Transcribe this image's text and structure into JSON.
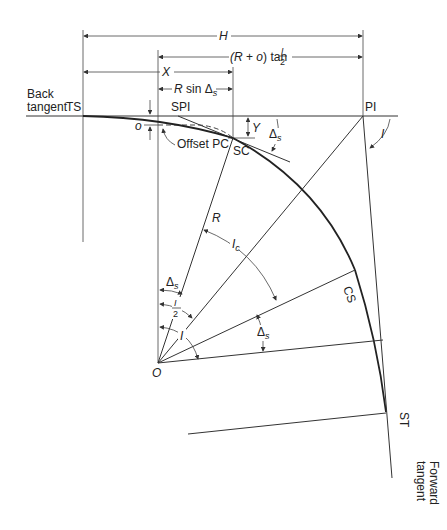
{
  "labels": {
    "back_tangent_line1": "Back",
    "back_tangent_line2": "tangent",
    "ts": "TS",
    "spi": "SPI",
    "pi": "PI",
    "sc": "SC",
    "cs": "CS",
    "st": "ST",
    "o_small": "o",
    "offset_pc": "Offset PC",
    "forward_tangent_line1": "Forward",
    "forward_tangent_line2": "tangent",
    "center": "O",
    "radius": "R",
    "y": "Y",
    "h": "H",
    "x": "X",
    "r_plus_o_tan": "(R + o) tan ",
    "i_over": "I",
    "two": "2",
    "r_sin": "R sin Δ",
    "s": "s",
    "delta": "Δ",
    "ic": "I",
    "c": "c",
    "i": "I"
  }
}
